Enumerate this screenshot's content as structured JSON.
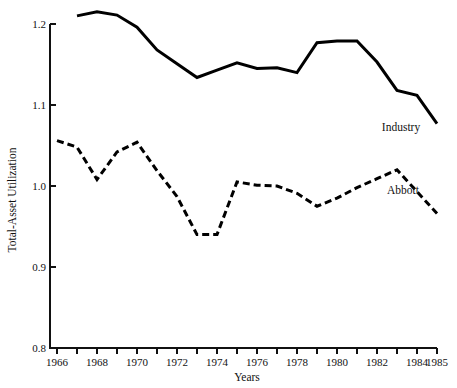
{
  "chart_data": {
    "type": "line",
    "title": "",
    "xlabel": "Years",
    "ylabel": "Total-Asset Utilization",
    "xlim": [
      1966,
      1985
    ],
    "ylim": [
      0.8,
      1.2
    ],
    "grid": false,
    "legend_position": "inline-annotation",
    "x": [
      1966,
      1967,
      1968,
      1969,
      1970,
      1971,
      1972,
      1973,
      1974,
      1975,
      1976,
      1977,
      1978,
      1979,
      1980,
      1981,
      1982,
      1983,
      1984,
      1985
    ],
    "y_ticks": [
      "0.8",
      "0.9",
      "1.0",
      "1.1",
      "1.2"
    ],
    "y_tick_values": [
      0.8,
      0.9,
      1.0,
      1.1,
      1.2
    ],
    "x_ticks": [
      1966,
      1967,
      1968,
      1969,
      1970,
      1971,
      1972,
      1973,
      1974,
      1975,
      1976,
      1977,
      1978,
      1979,
      1980,
      1981,
      1982,
      1983,
      1984,
      1985
    ],
    "x_tick_labels": [
      "1966",
      "",
      "1968",
      "",
      "1970",
      "",
      "1972",
      "",
      "1974",
      "",
      "1976",
      "",
      "1978",
      "",
      "1980",
      "",
      "1982",
      "",
      "1984",
      "1985"
    ],
    "series": [
      {
        "name": "Industry",
        "style": "solid",
        "color": "#000000",
        "x": [
          1967,
          1968,
          1969,
          1970,
          1971,
          1972,
          1973,
          1974,
          1975,
          1976,
          1977,
          1978,
          1979,
          1980,
          1981,
          1982,
          1983,
          1984,
          1985
        ],
        "values": [
          1.21,
          1.215,
          1.211,
          1.196,
          1.168,
          1.151,
          1.134,
          1.143,
          1.152,
          1.145,
          1.146,
          1.14,
          1.177,
          1.179,
          1.179,
          1.153,
          1.118,
          1.112,
          1.077
        ]
      },
      {
        "name": "Abbott",
        "style": "dashed",
        "color": "#000000",
        "x": [
          1966,
          1967,
          1968,
          1969,
          1970,
          1971,
          1972,
          1973,
          1974,
          1975,
          1976,
          1977,
          1978,
          1979,
          1980,
          1981,
          1982,
          1983,
          1984,
          1985
        ],
        "values": [
          1.056,
          1.048,
          1.008,
          1.042,
          1.054,
          1.019,
          0.987,
          0.94,
          0.94,
          1.005,
          1.001,
          1.0,
          0.991,
          0.975,
          0.985,
          0.998,
          1.009,
          1.02,
          0.993,
          0.966
        ]
      }
    ],
    "annotations": [
      {
        "text": "Industry",
        "x": 1983.2,
        "y": 1.068
      },
      {
        "text": "Abbott",
        "x": 1983.3,
        "y": 0.99
      }
    ]
  }
}
